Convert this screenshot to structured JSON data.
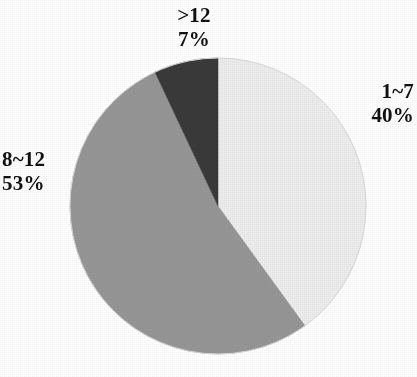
{
  "chart_data": {
    "type": "pie",
    "title": "",
    "subtitle": "",
    "xlabel": "",
    "ylabel": "",
    "legend_position": "none",
    "grid": false,
    "labels_inline": true,
    "start_angle_deg": 0,
    "direction": "clockwise",
    "categories": [
      "1~7",
      "8~12",
      ">12"
    ],
    "values": [
      40,
      53,
      7
    ],
    "value_unit": "%",
    "slices": [
      {
        "name": "slice-1-7",
        "category": "1~7",
        "percent": 40,
        "percent_text": "40%",
        "color": "#ededed",
        "label_position": "right"
      },
      {
        "name": "slice-8-12",
        "category": "8~12",
        "percent": 53,
        "percent_text": "53%",
        "color": "#969696",
        "label_position": "left"
      },
      {
        "name": "slice-gt-12",
        "category": ">12",
        "percent": 7,
        "percent_text": "7%",
        "color": "#3a3a3a",
        "label_position": "top"
      }
    ]
  },
  "labels": {
    "gt12": {
      "category": ">12",
      "percent": "7%"
    },
    "r1_7": {
      "category": "1~7",
      "percent": "40%"
    },
    "r8_12": {
      "category": "8~12",
      "percent": "53%"
    }
  },
  "colors": {
    "background": "#ffffff",
    "text": "#111111",
    "slice_light": "#ededed",
    "slice_mid": "#969696",
    "slice_dark": "#3a3a3a",
    "outline": "#d8d8d8"
  }
}
